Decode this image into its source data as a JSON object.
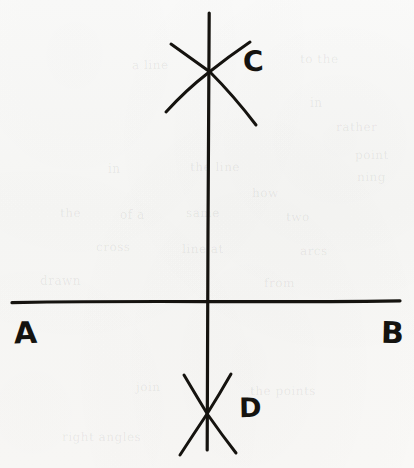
{
  "figure": {
    "kind": "hand-drawn-geometry-construction",
    "medium": "pen on paper, scanned",
    "paper_color": "#f8f8f6",
    "ink_color": "#15130f",
    "width": 414,
    "height": 468
  },
  "labels": {
    "a": "A",
    "b": "B",
    "c": "C",
    "d": "D"
  },
  "lines": {
    "horizontal": {
      "name": "line-AB",
      "from": [
        12,
        302
      ],
      "to": [
        400,
        301
      ],
      "stroke_width": 3.2
    },
    "vertical": {
      "name": "line-CD",
      "from": [
        209,
        13
      ],
      "to": [
        207,
        450
      ],
      "stroke_width": 3.2
    }
  },
  "arcs": {
    "top": [
      {
        "name": "arc-top-left-to-right",
        "from": [
          171,
          44
        ],
        "control": [
          214,
          80
        ],
        "to": [
          256,
          125
        ],
        "stroke_width": 3.0
      },
      {
        "name": "arc-top-right-to-left",
        "from": [
          250,
          42
        ],
        "control": [
          206,
          74
        ],
        "to": [
          166,
          112
        ],
        "stroke_width": 3.0
      }
    ],
    "bottom": [
      {
        "name": "arc-bottom-left-to-right",
        "from": [
          184,
          375
        ],
        "control": [
          208,
          416
        ],
        "to": [
          236,
          453
        ],
        "stroke_width": 3.0
      },
      {
        "name": "arc-bottom-right-to-left",
        "from": [
          231,
          374
        ],
        "control": [
          206,
          414
        ],
        "to": [
          180,
          455
        ],
        "stroke_width": 3.0
      }
    ]
  },
  "intersections": {
    "origin": [
      208,
      302
    ],
    "upper_arc_crossing": [
      208,
      70
    ],
    "lower_arc_crossing": [
      208,
      415
    ]
  },
  "show_through": [
    {
      "text": "a line",
      "x": 132,
      "y": 58,
      "size": 12,
      "rot": -0.4
    },
    {
      "text": "to the",
      "x": 300,
      "y": 52,
      "size": 12,
      "rot": 0.3
    },
    {
      "text": "in",
      "x": 310,
      "y": 96,
      "size": 12,
      "rot": 0
    },
    {
      "text": "rather",
      "x": 336,
      "y": 120,
      "size": 12,
      "rot": 0.2
    },
    {
      "text": "point",
      "x": 355,
      "y": 148,
      "size": 12,
      "rot": -0.3
    },
    {
      "text": "ning",
      "x": 357,
      "y": 170,
      "size": 12,
      "rot": 0.2
    },
    {
      "text": "in",
      "x": 108,
      "y": 162,
      "size": 12,
      "rot": 0
    },
    {
      "text": "the line",
      "x": 190,
      "y": 160,
      "size": 12,
      "rot": 0.2
    },
    {
      "text": "how",
      "x": 252,
      "y": 186,
      "size": 12,
      "rot": -0.2
    },
    {
      "text": "the",
      "x": 60,
      "y": 206,
      "size": 12,
      "rot": 0.3
    },
    {
      "text": "of a",
      "x": 120,
      "y": 208,
      "size": 12,
      "rot": 0
    },
    {
      "text": "same",
      "x": 186,
      "y": 206,
      "size": 12,
      "rot": -0.2
    },
    {
      "text": "two",
      "x": 286,
      "y": 210,
      "size": 12,
      "rot": 0.2
    },
    {
      "text": "cross",
      "x": 96,
      "y": 240,
      "size": 12,
      "rot": 0.2
    },
    {
      "text": "line at",
      "x": 182,
      "y": 242,
      "size": 12,
      "rot": -0.2
    },
    {
      "text": "arcs",
      "x": 300,
      "y": 244,
      "size": 12,
      "rot": 0.3
    },
    {
      "text": "drawn",
      "x": 40,
      "y": 274,
      "size": 12,
      "rot": 0
    },
    {
      "text": "from",
      "x": 264,
      "y": 276,
      "size": 12,
      "rot": 0.2
    },
    {
      "text": "join",
      "x": 136,
      "y": 380,
      "size": 12,
      "rot": -0.3
    },
    {
      "text": "the points",
      "x": 250,
      "y": 384,
      "size": 12,
      "rot": 0.2
    },
    {
      "text": "right angles",
      "x": 62,
      "y": 430,
      "size": 12,
      "rot": 0.2
    }
  ]
}
